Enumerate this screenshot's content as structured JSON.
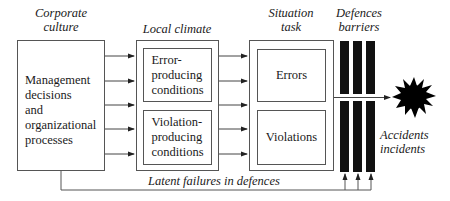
{
  "diagram": {
    "headings": {
      "corporate": "Corporate\nculture",
      "corporate_line1": "Corporate",
      "corporate_line2": "culture",
      "local": "Local climate",
      "situation_line1": "Situation",
      "situation_line2": "task",
      "defences_line1": "Defences",
      "defences_line2": "barriers"
    },
    "boxes": {
      "management_lines": [
        "Management",
        "decisions",
        "and",
        "organizational",
        "processes"
      ],
      "error_producing_lines": [
        "Error-",
        "producing",
        "conditions"
      ],
      "violation_producing_lines": [
        "Violation-",
        "producing",
        "conditions"
      ],
      "errors": "Errors",
      "violations": "Violations"
    },
    "outcome": {
      "line1": "Accidents",
      "line2": "incidents"
    },
    "feedback_label": "Latent failures in defences",
    "icons": {
      "explosion": "explosion-starburst-icon"
    },
    "colors": {
      "line": "#555555",
      "barrier": "#111111",
      "text": "#1a1a1a"
    }
  }
}
